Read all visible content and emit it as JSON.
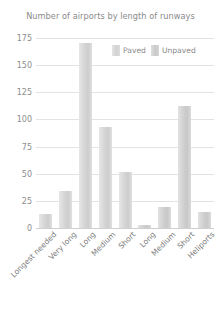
{
  "chart_data": {
    "type": "bar",
    "title": "Number of airports by length of runways",
    "xlabel": "",
    "ylabel": "",
    "ylim": [
      0,
      175
    ],
    "yticks": [
      0,
      25,
      50,
      75,
      100,
      125,
      150,
      175
    ],
    "grid": true,
    "legend_position": "top-right",
    "categories": [
      "Longest needed",
      "Very long",
      "Long",
      "Medium",
      "Short",
      "Long",
      "Medium",
      "Short",
      "Heliports"
    ],
    "series": [
      {
        "name": "Paved",
        "color": "#d4d4d4",
        "values": [
          13,
          34,
          170,
          93,
          52,
          null,
          null,
          null,
          null
        ]
      },
      {
        "name": "Unpaved",
        "color": "#cfcfcf",
        "values": [
          null,
          null,
          null,
          null,
          null,
          3,
          19,
          112,
          15
        ]
      }
    ],
    "values": [
      13,
      34,
      170,
      93,
      52,
      3,
      19,
      112,
      15
    ],
    "bar_groups": [
      {
        "label": "Longest needed",
        "value": 13,
        "series": "Paved"
      },
      {
        "label": "Very long",
        "value": 34,
        "series": "Paved"
      },
      {
        "label": "Long",
        "value": 170,
        "series": "Paved"
      },
      {
        "label": "Medium",
        "value": 93,
        "series": "Paved"
      },
      {
        "label": "Short",
        "value": 52,
        "series": "Paved"
      },
      {
        "label": "Long",
        "value": 3,
        "series": "Unpaved"
      },
      {
        "label": "Medium",
        "value": 19,
        "series": "Unpaved"
      },
      {
        "label": "Short",
        "value": 112,
        "series": "Unpaved"
      },
      {
        "label": "Heliports",
        "value": 15,
        "series": "Unpaved"
      }
    ]
  },
  "legend": {
    "items": [
      {
        "label": "Paved"
      },
      {
        "label": "Unpaved"
      }
    ]
  }
}
